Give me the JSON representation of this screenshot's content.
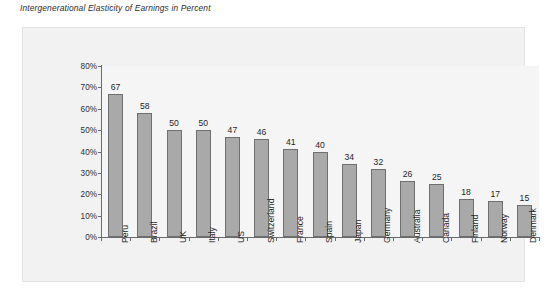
{
  "chart_data": {
    "type": "bar",
    "title": "Intergenerational Elasticity of Earnings in Percent",
    "xlabel": "",
    "ylabel": "",
    "ylim": [
      0,
      80
    ],
    "ytick_labels": [
      "80%",
      "70%",
      "60%",
      "50%",
      "40%",
      "30%",
      "20%",
      "10%",
      "0%"
    ],
    "ytick_values": [
      80,
      70,
      60,
      50,
      40,
      30,
      20,
      10,
      0
    ],
    "grid": false,
    "legend": "none",
    "data_labels_shown": true,
    "categories": [
      "Peru",
      "Brazil",
      "UK",
      "Italy",
      "US",
      "Switzerland",
      "France",
      "Spain",
      "Japan",
      "Germany",
      "Australia",
      "Canada",
      "Finland",
      "Norway",
      "Denmark"
    ],
    "values": [
      67,
      58,
      50,
      50,
      47,
      46,
      41,
      40,
      34,
      32,
      26,
      25,
      18,
      17,
      15
    ],
    "value_labels": [
      "67",
      "58",
      "50",
      "50",
      "47",
      "46",
      "41",
      "40",
      "34",
      "32",
      "26",
      "25",
      "18",
      "17",
      "15"
    ],
    "colors": {
      "bar_fill": "#a9a9a9",
      "bar_edge": "#6f6f6f",
      "plot_background": "#f5f5f5",
      "panel_background": "#f2f2f2",
      "axis": "#6b6b6b",
      "text": "#1f1f1f"
    }
  }
}
